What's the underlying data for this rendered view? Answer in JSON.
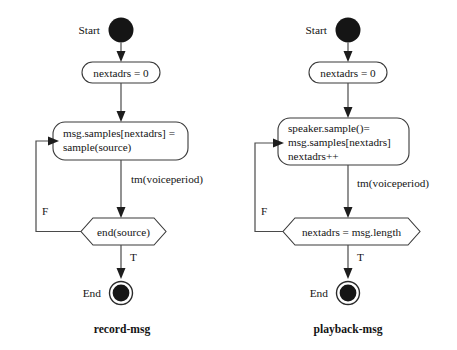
{
  "figure": {
    "type": "uml-activity-diagram",
    "background_color": "#ffffff",
    "line_color": "#4a4a4a",
    "text_color": "#141414",
    "node_fill": "#ffffff"
  },
  "diagrams": [
    {
      "id": "record-msg",
      "caption": "record-msg",
      "start_label": "Start",
      "end_label": "End",
      "action_1": "nextadrs = 0",
      "action_2_line_1": "msg.samples[nextadrs] =",
      "action_2_line_2": "sample(source)",
      "transition_label": "tm(voiceperiod)",
      "decision": "end(source)",
      "branch_true": "T",
      "branch_false": "F"
    },
    {
      "id": "playback-msg",
      "caption": "playback-msg",
      "start_label": "Start",
      "end_label": "End",
      "action_1": "nextadrs = 0",
      "action_2_line_1": "speaker.sample()=",
      "action_2_line_2": "msg.samples[nextadrs]",
      "action_2_line_3": "nextadrs++",
      "transition_label": "tm(voiceperiod)",
      "decision": "nextadrs = msg.length",
      "branch_true": "T",
      "branch_false": "F"
    }
  ]
}
